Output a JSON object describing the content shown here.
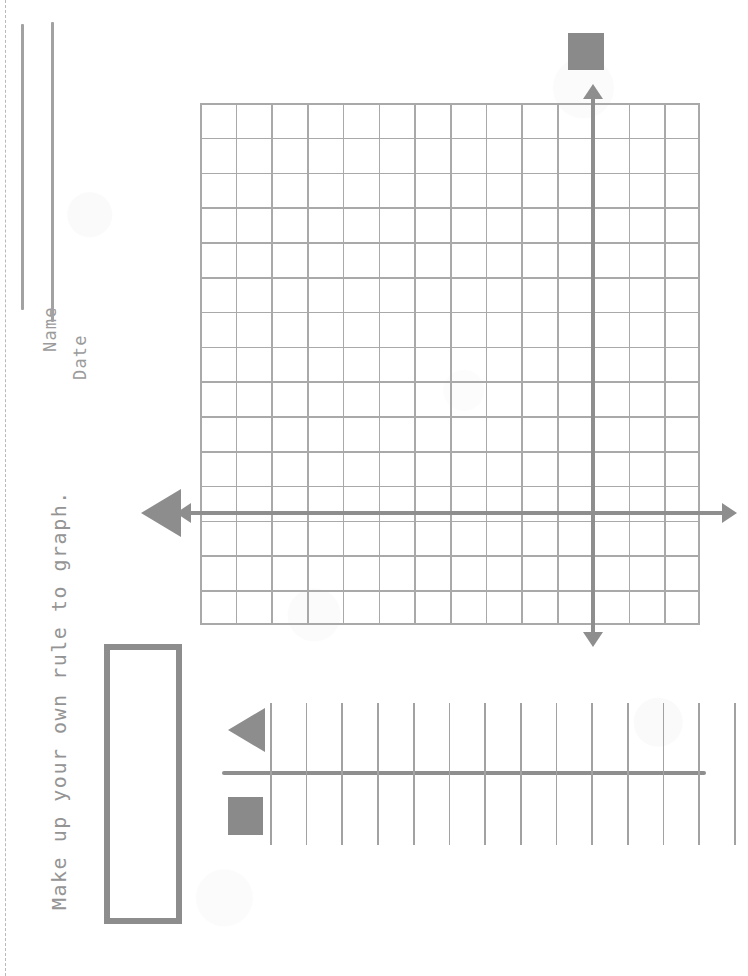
{
  "worksheet": {
    "name_label": "Name",
    "date_label": "Date",
    "instruction": "Make up your own rule to graph.",
    "colors": {
      "paper": "#fdfdfd",
      "ink_light": "#a9a9a9",
      "ink_medium": "#9b9b9b",
      "ink_dark": "#8a8a8a",
      "fold_line": "#b9b9b9"
    }
  },
  "coordinate_grid": {
    "columns": 14,
    "rows": 15,
    "cell_width_px": 35.7,
    "cell_height_px": 34.8,
    "x_axis": {
      "label": "",
      "arrow_left": true,
      "arrow_right": true
    },
    "y_axis": {
      "label": "",
      "arrow_up": true,
      "arrow_down": true
    },
    "markers": [
      {
        "shape": "square",
        "position": "above-y-axis"
      },
      {
        "shape": "triangle",
        "position": "left-of-x-axis",
        "direction": "left"
      }
    ]
  },
  "number_line": {
    "tick_count": 14,
    "tick_spacing_px": 35.7,
    "markers": [
      {
        "shape": "triangle",
        "position": "above-left",
        "direction": "left"
      },
      {
        "shape": "square",
        "position": "below-left"
      }
    ]
  },
  "answer_box": {
    "value": "",
    "placeholder": ""
  }
}
